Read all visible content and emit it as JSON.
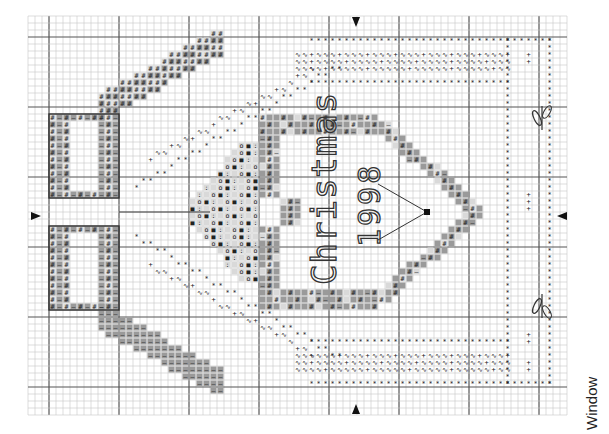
{
  "caption": "Window",
  "heart_text": {
    "line1": "Christmas",
    "line2": "1998"
  },
  "grid": {
    "x0": 28,
    "y0": 16,
    "cell": 7,
    "cols": 77,
    "rows": 57,
    "major_every": 10,
    "major_x_offset": 3,
    "major_y_offset": 3,
    "line_color": "#c8c8c8",
    "major_color": "#555555"
  },
  "colors": {
    "dark_fill": "#9a9a9a",
    "mid_fill": "#bdbdbd",
    "light_fill": "#d9d9d9",
    "outline": "#333333",
    "symbol": "#222222"
  },
  "center_arrows": [
    {
      "dir": "down",
      "x": 356,
      "y": 22
    },
    {
      "dir": "up",
      "x": 356,
      "y": 409
    },
    {
      "dir": "right",
      "x": 36,
      "y": 216
    },
    {
      "dir": "left",
      "x": 562,
      "y": 216
    }
  ],
  "legend_symbols": [
    "#",
    "—",
    "*",
    "+",
    "∿",
    "o",
    "■",
    ":"
  ],
  "motifs": [
    "bow",
    "heart",
    "holly-sprig",
    "inner-border",
    "outer-border",
    "diagonal-stitch-rows"
  ]
}
